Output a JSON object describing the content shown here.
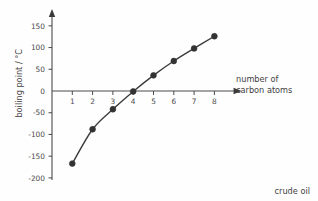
{
  "caption": "crude oil",
  "axes": {
    "x_title_line1": "number of",
    "x_title_line2": "carbon atoms",
    "y_title": "boiling point / °C"
  },
  "chart_data": {
    "type": "line",
    "title": "",
    "subtitle": "",
    "xlabel": "number of carbon atoms",
    "ylabel": "boiling point / °C",
    "x": [
      1,
      2,
      3,
      4,
      5,
      6,
      7,
      8
    ],
    "values": [
      -167,
      -88,
      -42,
      -1,
      36,
      69,
      98,
      126
    ],
    "series": [
      {
        "name": "boiling point",
        "values": [
          -167,
          -88,
          -42,
          -1,
          36,
          69,
          98,
          126
        ]
      }
    ],
    "xlim": [
      0,
      8.6
    ],
    "ylim": [
      -200,
      175
    ],
    "x_ticks": [
      1,
      2,
      3,
      4,
      5,
      6,
      7,
      8
    ],
    "x_tick_labels": [
      "1",
      "2",
      "3",
      "4",
      "5",
      "6",
      "7",
      "8"
    ],
    "y_ticks": [
      150,
      100,
      50,
      0,
      -50,
      -100,
      -150,
      -200
    ],
    "y_tick_labels": [
      "150",
      "100",
      "50",
      "0",
      "-50",
      "-100",
      "-150",
      "-200"
    ],
    "grid": false,
    "legend": "none",
    "marker": "filled-circle",
    "line_color": "#3c3c3c",
    "marker_color": "#333333",
    "axis_color": "#4a4a4a",
    "background_color": "#fefefe",
    "x_axis_arrow": true,
    "y_axis_arrow": true
  }
}
